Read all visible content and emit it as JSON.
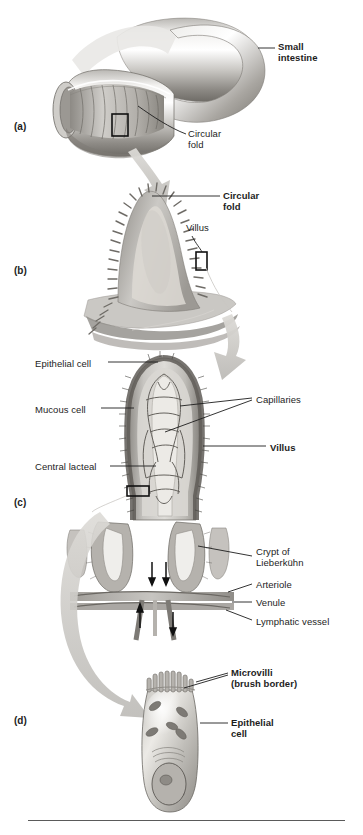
{
  "figure": {
    "domain": "anatomical-diagram",
    "style": "grayscale-textbook-illustration"
  },
  "colors": {
    "background": "#ffffff",
    "text": "#1d1d1d",
    "leader_line": "#1d1d1d",
    "rule": "#5a5a5a",
    "tissue_light": "#d8d6d2",
    "tissue_mid": "#a9a6a1",
    "tissue_dark": "#6e6b66",
    "outline_dark": "#4a4843",
    "arrow_gray": "#c9c7c3"
  },
  "panels": [
    {
      "id": "a",
      "marker": "(a)",
      "marker_pos": {
        "x": 14,
        "y": 121
      },
      "subject": "small-intestine-segment",
      "labels": [
        {
          "name": "small-intestine",
          "text": "Small\nintestine",
          "bold": true,
          "x": 278,
          "y": 41
        },
        {
          "name": "circular-fold-a",
          "text": "Circular\nfold",
          "bold": false,
          "x": 188,
          "y": 128
        }
      ]
    },
    {
      "id": "b",
      "marker": "(b)",
      "marker_pos": {
        "x": 14,
        "y": 265
      },
      "subject": "circular-fold-with-villi",
      "labels": [
        {
          "name": "circular-fold-b",
          "text": "Circular\nfold",
          "bold": true,
          "x": 223,
          "y": 190
        },
        {
          "name": "villus-b",
          "text": "Villus",
          "bold": false,
          "x": 186,
          "y": 222
        }
      ]
    },
    {
      "id": "c",
      "marker": "(c)",
      "marker_pos": {
        "x": 14,
        "y": 497
      },
      "subject": "single-villus-with-crypts-and-vessels",
      "labels": [
        {
          "name": "epithelial-cell-c",
          "text": "Epithelial cell",
          "bold": false,
          "x": 35,
          "y": 358
        },
        {
          "name": "mucous-cell",
          "text": "Mucous cell",
          "bold": false,
          "x": 35,
          "y": 404
        },
        {
          "name": "central-lacteal",
          "text": "Central lacteal",
          "bold": false,
          "x": 35,
          "y": 461
        },
        {
          "name": "capillaries",
          "text": "Capillaries",
          "bold": false,
          "x": 256,
          "y": 394
        },
        {
          "name": "villus-c",
          "text": "Villus",
          "bold": true,
          "x": 270,
          "y": 442
        },
        {
          "name": "crypt-of-lieberkuhn",
          "text": "Crypt of\nLieberkühn",
          "bold": false,
          "x": 256,
          "y": 546
        },
        {
          "name": "arteriole",
          "text": "Arteriole",
          "bold": false,
          "x": 256,
          "y": 579
        },
        {
          "name": "venule",
          "text": "Venule",
          "bold": false,
          "x": 256,
          "y": 597
        },
        {
          "name": "lymphatic-vessel",
          "text": "Lymphatic vessel",
          "bold": false,
          "x": 256,
          "y": 616
        }
      ]
    },
    {
      "id": "d",
      "marker": "(d)",
      "marker_pos": {
        "x": 14,
        "y": 715
      },
      "subject": "epithelial-cell-with-microvilli",
      "labels": [
        {
          "name": "microvilli",
          "text": "Microvilli\n(brush border)",
          "bold": true,
          "x": 231,
          "y": 667
        },
        {
          "name": "epithelial-cell-d",
          "text": "Epithelial\ncell",
          "bold": true,
          "x": 231,
          "y": 717
        }
      ]
    }
  ],
  "magnification_arrows": [
    {
      "name": "arrow-a-to-b",
      "from_panel": "a",
      "to_panel": "b"
    },
    {
      "name": "arrow-b-to-c",
      "from_panel": "b",
      "to_panel": "c"
    },
    {
      "name": "arrow-c-to-d",
      "from_panel": "c",
      "to_panel": "d"
    }
  ],
  "callout_boxes": [
    {
      "name": "callout-box-a",
      "panel": "a",
      "x": 112,
      "y": 114,
      "w": 16,
      "h": 22
    },
    {
      "name": "callout-box-b",
      "panel": "b",
      "x": 196,
      "y": 252,
      "w": 11,
      "h": 18
    },
    {
      "name": "callout-box-c",
      "panel": "c",
      "x": 127,
      "y": 486,
      "w": 22,
      "h": 10
    }
  ]
}
